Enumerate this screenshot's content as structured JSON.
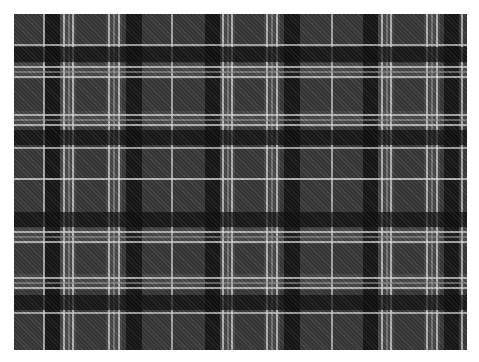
{
  "image": {
    "subject": "Grey, black and white tartan plaid fabric pattern",
    "fabric": {
      "left": 14,
      "top": 14,
      "width": 453,
      "height": 336
    },
    "colors": {
      "ground": "#3b3b3b",
      "black": "#0e0e0e",
      "light": "#9a9a9a",
      "white": "#dcdcdc",
      "background": "#ffffff"
    },
    "vertical_stripes": [
      {
        "x": 29,
        "w": 2,
        "color": "#dcdcdc",
        "opacity": 0.7
      },
      {
        "x": 31,
        "w": 15,
        "color": "#0e0e0e",
        "opacity": 0.75
      },
      {
        "x": 49,
        "w": 2,
        "color": "#dcdcdc",
        "opacity": 0.75
      },
      {
        "x": 54,
        "w": 2,
        "color": "#9a9a9a",
        "opacity": 0.6
      },
      {
        "x": 58,
        "w": 2,
        "color": "#dcdcdc",
        "opacity": 0.75
      },
      {
        "x": 94,
        "w": 2,
        "color": "#dcdcdc",
        "opacity": 0.75
      },
      {
        "x": 99,
        "w": 2,
        "color": "#9a9a9a",
        "opacity": 0.6
      },
      {
        "x": 104,
        "w": 2,
        "color": "#dcdcdc",
        "opacity": 0.75
      },
      {
        "x": 112,
        "w": 16,
        "color": "#0e0e0e",
        "opacity": 0.75
      },
      {
        "x": 157,
        "w": 2,
        "color": "#dcdcdc",
        "opacity": 0.7
      },
      {
        "x": 191,
        "w": 15,
        "color": "#0e0e0e",
        "opacity": 0.75
      },
      {
        "x": 208,
        "w": 2,
        "color": "#dcdcdc",
        "opacity": 0.75
      },
      {
        "x": 213,
        "w": 2,
        "color": "#9a9a9a",
        "opacity": 0.6
      },
      {
        "x": 217,
        "w": 2,
        "color": "#dcdcdc",
        "opacity": 0.75
      },
      {
        "x": 252,
        "w": 2,
        "color": "#dcdcdc",
        "opacity": 0.75
      },
      {
        "x": 257,
        "w": 2,
        "color": "#9a9a9a",
        "opacity": 0.6
      },
      {
        "x": 262,
        "w": 2,
        "color": "#dcdcdc",
        "opacity": 0.75
      },
      {
        "x": 270,
        "w": 16,
        "color": "#0e0e0e",
        "opacity": 0.75
      },
      {
        "x": 317,
        "w": 2,
        "color": "#dcdcdc",
        "opacity": 0.7
      },
      {
        "x": 349,
        "w": 15,
        "color": "#0e0e0e",
        "opacity": 0.75
      },
      {
        "x": 367,
        "w": 2,
        "color": "#dcdcdc",
        "opacity": 0.75
      },
      {
        "x": 372,
        "w": 2,
        "color": "#9a9a9a",
        "opacity": 0.6
      },
      {
        "x": 376,
        "w": 2,
        "color": "#dcdcdc",
        "opacity": 0.75
      },
      {
        "x": 412,
        "w": 2,
        "color": "#dcdcdc",
        "opacity": 0.75
      },
      {
        "x": 417,
        "w": 2,
        "color": "#9a9a9a",
        "opacity": 0.6
      },
      {
        "x": 422,
        "w": 2,
        "color": "#dcdcdc",
        "opacity": 0.75
      },
      {
        "x": 430,
        "w": 15,
        "color": "#0e0e0e",
        "opacity": 0.75
      },
      {
        "x": 447,
        "w": 2,
        "color": "#dcdcdc",
        "opacity": 0.7
      }
    ],
    "horizontal_stripes": [
      {
        "y": 30,
        "h": 2,
        "color": "#dcdcdc",
        "opacity": 0.7
      },
      {
        "y": 33,
        "h": 15,
        "color": "#0e0e0e",
        "opacity": 0.7
      },
      {
        "y": 52,
        "h": 2,
        "color": "#dcdcdc",
        "opacity": 0.75
      },
      {
        "y": 57,
        "h": 2,
        "color": "#9a9a9a",
        "opacity": 0.6
      },
      {
        "y": 62,
        "h": 2,
        "color": "#dcdcdc",
        "opacity": 0.75
      },
      {
        "y": 100,
        "h": 2,
        "color": "#dcdcdc",
        "opacity": 0.75
      },
      {
        "y": 105,
        "h": 2,
        "color": "#9a9a9a",
        "opacity": 0.6
      },
      {
        "y": 110,
        "h": 2,
        "color": "#dcdcdc",
        "opacity": 0.75
      },
      {
        "y": 116,
        "h": 15,
        "color": "#0e0e0e",
        "opacity": 0.7
      },
      {
        "y": 133,
        "h": 2,
        "color": "#dcdcdc",
        "opacity": 0.7
      },
      {
        "y": 164,
        "h": 2,
        "color": "#dcdcdc",
        "opacity": 0.8
      },
      {
        "y": 198,
        "h": 15,
        "color": "#0e0e0e",
        "opacity": 0.7
      },
      {
        "y": 217,
        "h": 2,
        "color": "#dcdcdc",
        "opacity": 0.75
      },
      {
        "y": 222,
        "h": 2,
        "color": "#9a9a9a",
        "opacity": 0.6
      },
      {
        "y": 227,
        "h": 2,
        "color": "#dcdcdc",
        "opacity": 0.75
      },
      {
        "y": 263,
        "h": 2,
        "color": "#dcdcdc",
        "opacity": 0.75
      },
      {
        "y": 268,
        "h": 2,
        "color": "#9a9a9a",
        "opacity": 0.6
      },
      {
        "y": 273,
        "h": 2,
        "color": "#dcdcdc",
        "opacity": 0.75
      },
      {
        "y": 281,
        "h": 15,
        "color": "#0e0e0e",
        "opacity": 0.7
      },
      {
        "y": 298,
        "h": 2,
        "color": "#dcdcdc",
        "opacity": 0.7
      }
    ],
    "light_bands": {
      "vertical": [
        {
          "x": 46,
          "w": 16
        },
        {
          "x": 92,
          "w": 16
        },
        {
          "x": 206,
          "w": 15
        },
        {
          "x": 250,
          "w": 16
        },
        {
          "x": 364,
          "w": 16
        },
        {
          "x": 410,
          "w": 16
        }
      ],
      "horizontal": [
        {
          "y": 49,
          "h": 16
        },
        {
          "y": 97,
          "h": 16
        },
        {
          "y": 214,
          "h": 16
        },
        {
          "y": 260,
          "h": 16
        }
      ]
    }
  }
}
